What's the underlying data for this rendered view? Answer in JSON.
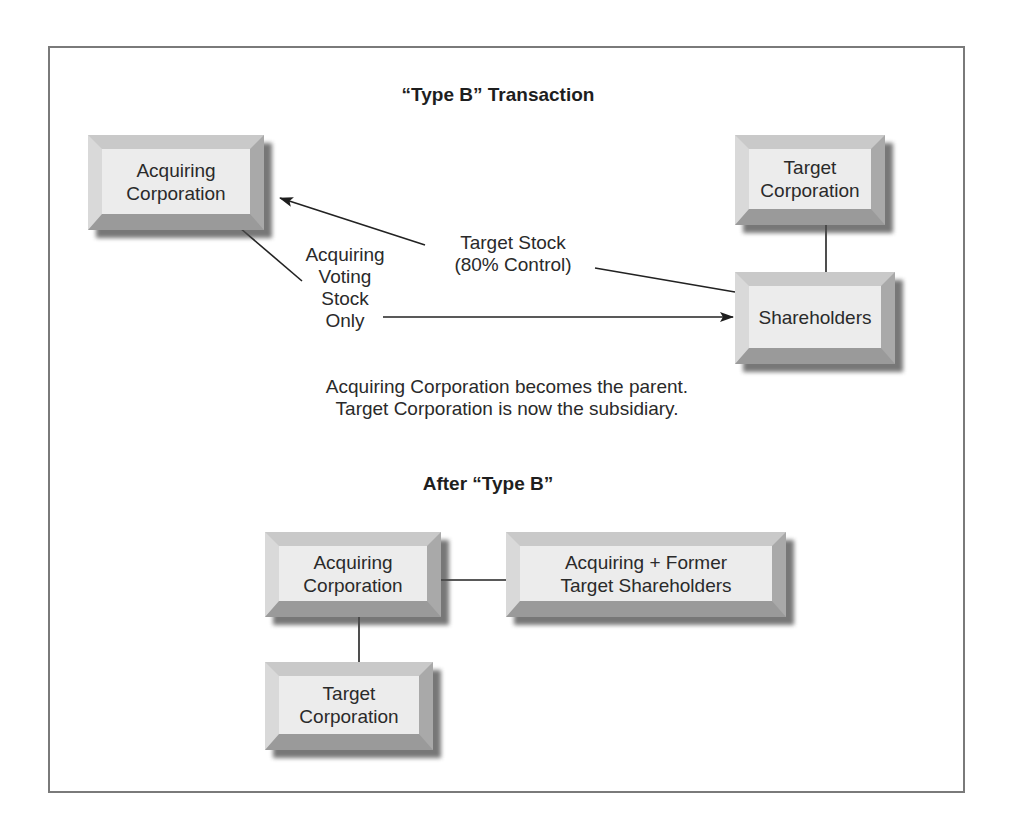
{
  "diagram": {
    "title": "“Type B” Transaction",
    "nodes": {
      "acquiring_corp": {
        "label_line1": "Acquiring",
        "label_line2": "Corporation"
      },
      "target_corp": {
        "label_line1": "Target",
        "label_line2": "Corporation"
      },
      "shareholders": {
        "label": "Shareholders"
      }
    },
    "edges": {
      "target_stock": {
        "line1": "Target Stock",
        "line2": "(80% Control)"
      },
      "voting_stock": {
        "line1": "Acquiring",
        "line2": "Voting",
        "line3": "Stock",
        "line4": "Only"
      }
    },
    "caption": {
      "line1": "Acquiring Corporation becomes the parent.",
      "line2": "Target Corporation is now the subsidiary."
    }
  },
  "after": {
    "title": "After “Type B”",
    "nodes": {
      "acquiring_corp": {
        "label_line1": "Acquiring",
        "label_line2": "Corporation"
      },
      "combined_shareholders": {
        "label_line1": "Acquiring + Former",
        "label_line2": "Target Shareholders"
      },
      "target_corp": {
        "label_line1": "Target",
        "label_line2": "Corporation"
      }
    }
  }
}
